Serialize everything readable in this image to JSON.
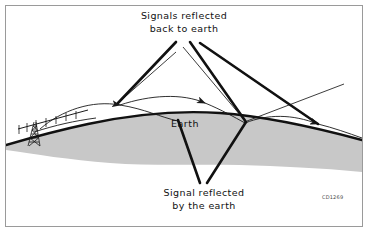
{
  "figure": {
    "kind": "ionospheric-sky-wave-propagation-diagram",
    "frame": {
      "border_color": "#9a9a9a",
      "background": "#ffffff"
    },
    "colors": {
      "earth_fill": "#c8c8c8",
      "earth_outline": "#111111",
      "ray_stroke": "#1a1a1a",
      "leader_stroke": "#111111",
      "text": "#111111",
      "code_text": "#4a4a4a"
    },
    "labels": {
      "top": {
        "line1": "Signals reflected",
        "line2": "back to earth"
      },
      "earth": "Earth",
      "bottom": {
        "line1": "Signal reflected",
        "line2": "by the earth"
      },
      "code": "CD1269"
    },
    "elements": {
      "antenna": "transmitting-antenna-tower",
      "ray_count": 5,
      "hop_count": 3
    }
  }
}
